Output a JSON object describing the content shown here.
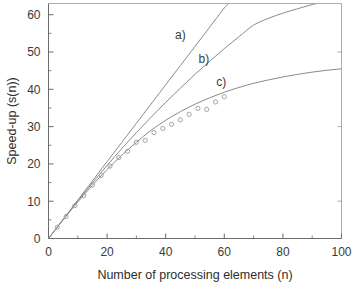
{
  "chart_data": {
    "type": "line",
    "title": "",
    "xlabel": "Number of processing elements (n)",
    "ylabel": "Speed-up (s(n))",
    "xlim": [
      0,
      100
    ],
    "ylim": [
      0,
      63
    ],
    "xticks": [
      0,
      20,
      40,
      60,
      80,
      100
    ],
    "yticks": [
      0,
      10,
      20,
      30,
      40,
      50,
      60
    ],
    "xticklabels": [
      "0",
      "20",
      "40",
      "60",
      "80",
      "100"
    ],
    "yticklabels": [
      "0",
      "10",
      "20",
      "30",
      "40",
      "50",
      "60"
    ],
    "grid": false,
    "legend_position": "inline-annotations",
    "annotations": [
      {
        "text": "a)",
        "x": 45,
        "y": 53.5
      },
      {
        "text": "b)",
        "x": 53,
        "y": 47.0
      },
      {
        "text": "c)",
        "x": 59,
        "y": 41.0
      }
    ],
    "series": [
      {
        "name": "a)",
        "label": "a)",
        "style": "line",
        "color": "#8a8a8a",
        "x": [
          0,
          5,
          10,
          15,
          20,
          25,
          30,
          35,
          40,
          45,
          50,
          55,
          60,
          61.5
        ],
        "values": [
          0,
          5.15,
          10.3,
          15.45,
          20.6,
          25.75,
          30.9,
          36.05,
          41.2,
          46.35,
          51.5,
          56.65,
          61.8,
          63.0
        ]
      },
      {
        "name": "b)",
        "label": "b)",
        "style": "line",
        "color": "#8a8a8a",
        "x": [
          0,
          5,
          10,
          15,
          20,
          25,
          30,
          35,
          40,
          45,
          50,
          55,
          60,
          65,
          70,
          75,
          80,
          85,
          90,
          91.5
        ],
        "values": [
          0,
          5.1,
          10.1,
          14.9,
          19.6,
          24.1,
          28.4,
          32.5,
          36.5,
          40.3,
          44.0,
          47.5,
          50.9,
          54.1,
          57.2,
          59.0,
          60.4,
          61.6,
          62.7,
          63.0
        ]
      },
      {
        "name": "c)",
        "label": "c)",
        "style": "line",
        "color": "#8a8a8a",
        "x": [
          0,
          5,
          10,
          15,
          20,
          25,
          30,
          35,
          40,
          45,
          50,
          55,
          60,
          65,
          70,
          75,
          80,
          85,
          90,
          95,
          100
        ],
        "values": [
          0,
          5.0,
          9.8,
          14.3,
          18.5,
          22.3,
          25.8,
          29.0,
          31.7,
          34.0,
          36.0,
          37.7,
          39.2,
          40.5,
          41.6,
          42.5,
          43.3,
          44.0,
          44.6,
          45.1,
          45.5
        ]
      },
      {
        "name": "measured",
        "label": "measured data points",
        "style": "open-circle-markers",
        "color": "#9a9a9a",
        "x": [
          3,
          6,
          9,
          12,
          15,
          18,
          21,
          24,
          27,
          30,
          33,
          36,
          39,
          42,
          45,
          48,
          51,
          54,
          57,
          60
        ],
        "values": [
          3.0,
          5.9,
          8.8,
          11.5,
          14.3,
          16.9,
          19.4,
          21.7,
          23.4,
          25.8,
          26.3,
          28.4,
          29.5,
          30.6,
          31.8,
          33.3,
          34.9,
          34.6,
          36.6,
          38.0
        ]
      }
    ]
  }
}
